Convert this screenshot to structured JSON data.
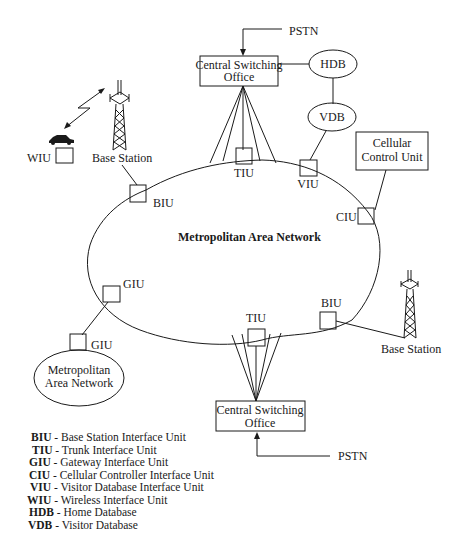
{
  "diagram": {
    "center_label": "Metropolitan Area Network",
    "nodes": {
      "pstn_top": "PSTN",
      "cso_top": [
        "Central Switching",
        "Office"
      ],
      "hdb": "HDB",
      "vdb": "VDB",
      "ccu": [
        "Cellular",
        "Control Unit"
      ],
      "wiu": "WIU",
      "base_station_left": "Base Station",
      "biu_left": "BIU",
      "tiu_top": "TIU",
      "viu": "VIU",
      "ciu": "CIU",
      "giu_ring": "GIU",
      "giu_man": "GIU",
      "man_small": [
        "Metropolitan",
        "Area Network"
      ],
      "tiu_bottom": "TIU",
      "biu_right": "BIU",
      "base_station_right": "Base Station",
      "cso_bottom": [
        "Central Switching",
        "Office"
      ],
      "pstn_bottom": "PSTN"
    }
  },
  "legend": [
    {
      "abbr": "BIU",
      "desc": " - Base Station Interface Unit"
    },
    {
      "abbr": "TIU",
      "desc": " - Trunk Interface Unit"
    },
    {
      "abbr": "GIU",
      "desc": " - Gateway Interface Unit"
    },
    {
      "abbr": "CIU",
      "desc": " - Cellular Controller Interface Unit"
    },
    {
      "abbr": "VIU",
      "desc": " - Visitor Database Interface Unit"
    },
    {
      "abbr": "WIU",
      "desc": " - Wireless Interface Unit"
    },
    {
      "abbr": "HDB",
      "desc": " - Home Database"
    },
    {
      "abbr": "VDB",
      "desc": " - Visitor Database"
    }
  ]
}
